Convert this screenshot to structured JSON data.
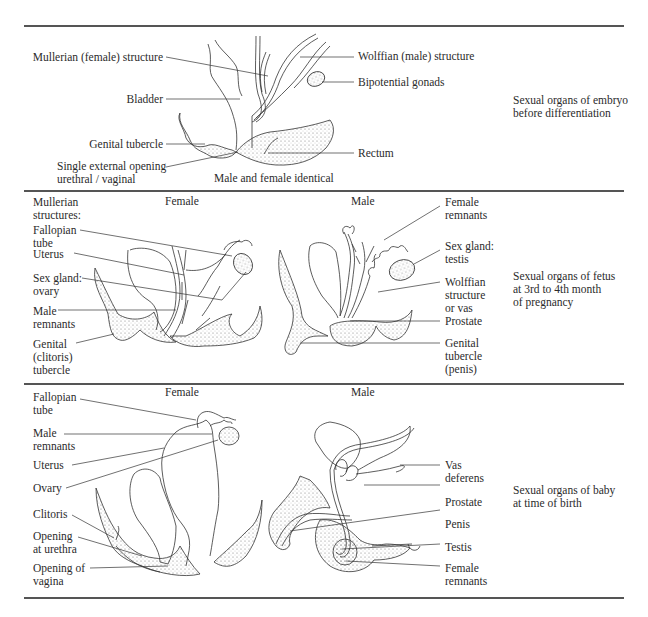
{
  "figure": {
    "panels": [
      {
        "id": "embryo",
        "caption": [
          "Sexual organs of embryo",
          "before differentiation"
        ],
        "subtitle": "Male and female identical",
        "left_labels": [
          {
            "text": "Mullerian (female) structure"
          },
          {
            "text": "Bladder"
          },
          {
            "text": "Genital tubercle"
          },
          {
            "text": "Single external opening",
            "text2": "urethral / vaginal"
          }
        ],
        "right_labels": [
          {
            "text": "Wolffian (male) structure"
          },
          {
            "text": "Bipotential gonads"
          },
          {
            "text": "Rectum"
          }
        ]
      },
      {
        "id": "fetus",
        "caption": [
          "Sexual organs of fetus",
          "at 3rd to 4th month",
          "of pregnancy"
        ],
        "female_heading": "Female",
        "male_heading": "Male",
        "left_labels": [
          {
            "lines": [
              "Mullerian",
              "structures:"
            ]
          },
          {
            "lines": [
              "Fallopian",
              "tube"
            ]
          },
          {
            "lines": [
              "Uterus"
            ]
          },
          {
            "lines": [
              "Sex gland:",
              "ovary"
            ]
          },
          {
            "lines": [
              "Male",
              "remnants"
            ]
          },
          {
            "lines": [
              "Genital",
              "(clitoris)",
              "tubercle"
            ]
          }
        ],
        "right_labels": [
          {
            "lines": [
              "Female",
              "remnants"
            ]
          },
          {
            "lines": [
              "Sex gland:",
              "testis"
            ]
          },
          {
            "lines": [
              "Wolffian",
              "structure",
              "or vas"
            ]
          },
          {
            "lines": [
              "Prostate"
            ]
          },
          {
            "lines": [
              "Genital",
              "tubercle",
              "(penis)"
            ]
          }
        ]
      },
      {
        "id": "birth",
        "caption": [
          "Sexual organs of baby",
          "at time of birth"
        ],
        "female_heading": "Female",
        "male_heading": "Male",
        "left_labels": [
          {
            "lines": [
              "Fallopian",
              "tube"
            ]
          },
          {
            "lines": [
              "Male",
              "remnants"
            ]
          },
          {
            "lines": [
              "Uterus"
            ]
          },
          {
            "lines": [
              "Ovary"
            ]
          },
          {
            "lines": [
              "Clitoris"
            ]
          },
          {
            "lines": [
              "Opening",
              "at urethra"
            ]
          },
          {
            "lines": [
              "Opening of",
              "vagina"
            ]
          }
        ],
        "right_labels": [
          {
            "lines": [
              "Vas",
              "deferens"
            ]
          },
          {
            "lines": [
              "Prostate"
            ]
          },
          {
            "lines": [
              "Penis"
            ]
          },
          {
            "lines": [
              "Testis"
            ]
          },
          {
            "lines": [
              "Female",
              "remnants"
            ]
          }
        ]
      }
    ],
    "colors": {
      "ink": "#2b2b2b",
      "rule": "#555555",
      "background": "#ffffff"
    }
  }
}
